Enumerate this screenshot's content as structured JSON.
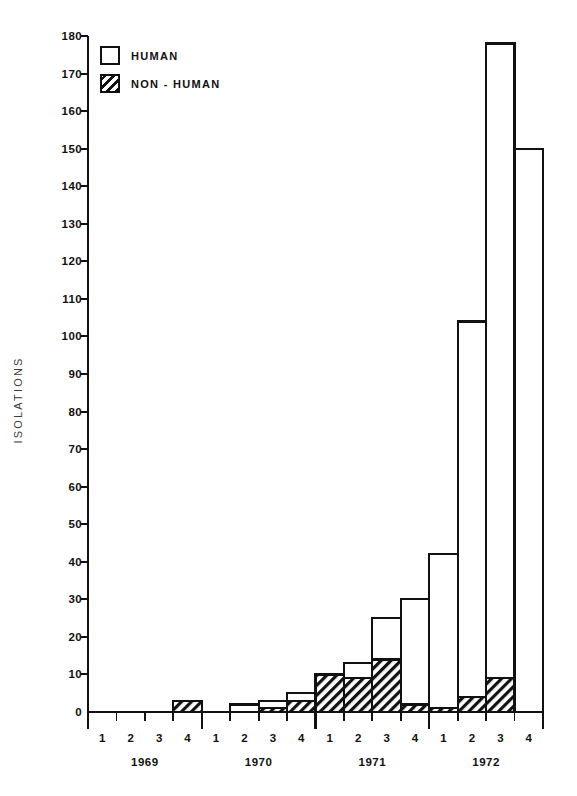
{
  "chart_data": {
    "type": "bar",
    "subtype": "stacked",
    "title": "",
    "xlabel": "",
    "ylabel": "ISOLATIONS",
    "ylim": [
      0,
      180
    ],
    "ytick_step": 10,
    "yticks": [
      0,
      10,
      20,
      30,
      40,
      50,
      60,
      70,
      80,
      90,
      100,
      110,
      120,
      130,
      140,
      150,
      160,
      170,
      180
    ],
    "grid": false,
    "legend_position": "top-left",
    "years": [
      "1969",
      "1970",
      "1971",
      "1972"
    ],
    "quarters": [
      "1",
      "2",
      "3",
      "4"
    ],
    "categories": [
      "1969 Q1",
      "1969 Q2",
      "1969 Q3",
      "1969 Q4",
      "1970 Q1",
      "1970 Q2",
      "1970 Q3",
      "1970 Q4",
      "1971 Q1",
      "1971 Q2",
      "1971 Q3",
      "1971 Q4",
      "1972 Q1",
      "1972 Q2",
      "1972 Q3",
      "1972 Q4"
    ],
    "series": [
      {
        "name": "HUMAN",
        "fill": "white",
        "values": [
          0,
          0,
          0,
          0,
          0,
          2,
          2,
          2,
          0,
          4,
          11,
          28,
          41,
          100,
          169,
          150
        ]
      },
      {
        "name": "NON-HUMAN",
        "fill": "hatched",
        "values": [
          0,
          0,
          0,
          3,
          0,
          0,
          1,
          3,
          10,
          9,
          14,
          2,
          1,
          4,
          9,
          0
        ]
      }
    ],
    "totals": [
      0,
      0,
      0,
      3,
      0,
      2,
      3,
      5,
      10,
      13,
      25,
      30,
      42,
      104,
      178,
      150
    ]
  },
  "legend": {
    "items": [
      {
        "label": "HUMAN",
        "fill": "white"
      },
      {
        "label": "NON-HUMAN",
        "fill": "hatched"
      }
    ]
  },
  "colors": {
    "ink": "#111111",
    "background": "#ffffff"
  }
}
